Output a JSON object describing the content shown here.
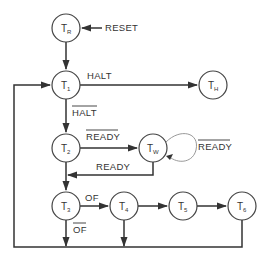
{
  "diagram": {
    "type": "state-transition",
    "states": [
      {
        "id": "TR",
        "label": "T",
        "sub": "R"
      },
      {
        "id": "T1",
        "label": "T",
        "sub": "1"
      },
      {
        "id": "TH",
        "label": "T",
        "sub": "H"
      },
      {
        "id": "T2",
        "label": "T",
        "sub": "2"
      },
      {
        "id": "TW",
        "label": "T",
        "sub": "W"
      },
      {
        "id": "T3",
        "label": "T",
        "sub": "3"
      },
      {
        "id": "T4",
        "label": "T",
        "sub": "4"
      },
      {
        "id": "T5",
        "label": "T",
        "sub": "5"
      },
      {
        "id": "T6",
        "label": "T",
        "sub": "6"
      }
    ],
    "labels": {
      "reset": "RESET",
      "halt": "HALT",
      "not_halt": "HALT",
      "not_ready_t2": "READY",
      "not_ready_loop": "READY",
      "ready": "READY",
      "of": "OF",
      "not_of": "OF"
    },
    "transitions": [
      {
        "from": "RESET",
        "to": "TR",
        "condition": "RESET"
      },
      {
        "from": "TR",
        "to": "T1",
        "condition": ""
      },
      {
        "from": "T1",
        "to": "TH",
        "condition": "HALT"
      },
      {
        "from": "T1",
        "to": "T2",
        "condition": "NOT HALT"
      },
      {
        "from": "T2",
        "to": "TW",
        "condition": "NOT READY"
      },
      {
        "from": "TW",
        "to": "TW",
        "condition": "NOT READY"
      },
      {
        "from": "TW",
        "to": "T3",
        "condition": "READY"
      },
      {
        "from": "T2",
        "to": "T3",
        "condition": ""
      },
      {
        "from": "T3",
        "to": "T4",
        "condition": "OF"
      },
      {
        "from": "T3",
        "to": "T1",
        "condition": "NOT OF"
      },
      {
        "from": "T4",
        "to": "T5",
        "condition": ""
      },
      {
        "from": "T4",
        "to": "T1",
        "condition": ""
      },
      {
        "from": "T5",
        "to": "T6",
        "condition": ""
      },
      {
        "from": "T6",
        "to": "T1",
        "condition": ""
      }
    ]
  }
}
